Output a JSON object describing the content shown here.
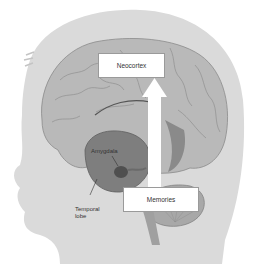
{
  "figure": {
    "colors": {
      "background": "#ffffff",
      "head": "#d9d9d9",
      "brain": "#b8b8b8",
      "brain_dark": "#8c8c8c",
      "temporal": "#7a7a7a",
      "cerebellum": "#a6a6a6",
      "box_fill": "#ffffff",
      "arrow": "#ffffff"
    }
  },
  "labels": {
    "neocortex": "Neocortex",
    "memories": "Memories",
    "amygdala": "Amygdala",
    "temporal_lobe_line1": "Temporal",
    "temporal_lobe_line2": "lobe"
  },
  "arrow": {
    "direction": "up",
    "from": "Memories",
    "to": "Neocortex"
  }
}
